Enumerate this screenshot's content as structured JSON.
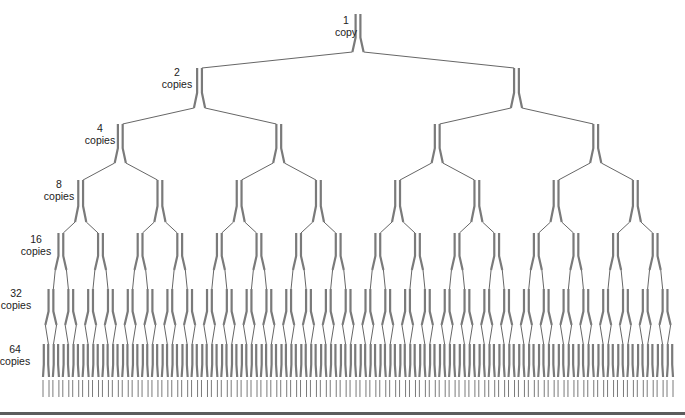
{
  "diagram": {
    "colors": {
      "strand": "#7a7a7a",
      "branch": "#555555",
      "text": "#222222",
      "rule": "#5c5c5c"
    },
    "layout": {
      "root_x": 358,
      "leaf_left": 46,
      "leaf_right": 670,
      "level_top_y": [
        14,
        68,
        124,
        180,
        233,
        289,
        344
      ],
      "level_bottom_y": [
        52,
        108,
        163,
        222,
        270,
        325,
        377
      ],
      "tail_bottom_y": 397
    },
    "levels": [
      {
        "count": 1,
        "num": "1",
        "unit": "copy",
        "label_x": 346,
        "label_y": 14
      },
      {
        "count": 2,
        "num": "2",
        "unit": "copies",
        "label_x": 177,
        "label_y": 66
      },
      {
        "count": 4,
        "num": "4",
        "unit": "copies",
        "label_x": 100,
        "label_y": 122
      },
      {
        "count": 8,
        "num": "8",
        "unit": "copies",
        "label_x": 59,
        "label_y": 178
      },
      {
        "count": 16,
        "num": "16",
        "unit": "copies",
        "label_x": 36,
        "label_y": 233
      },
      {
        "count": 32,
        "num": "32",
        "unit": "copies",
        "label_x": 16,
        "label_y": 287
      },
      {
        "count": 64,
        "num": "64",
        "unit": "copies",
        "label_x": 15,
        "label_y": 343
      }
    ]
  }
}
